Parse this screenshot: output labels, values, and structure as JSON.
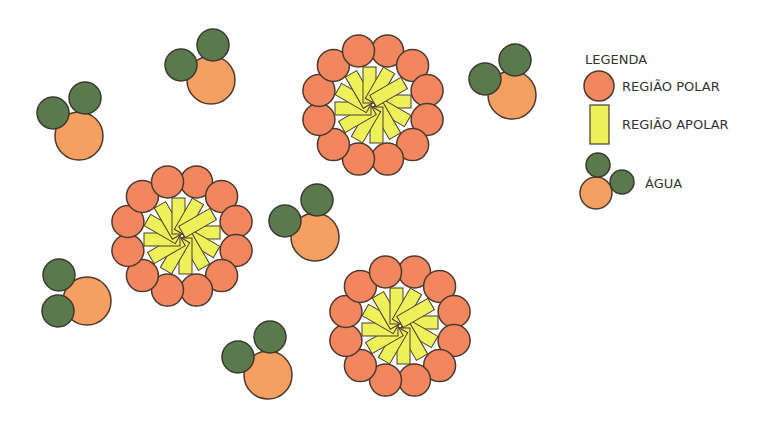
{
  "legend": {
    "title": "LEGENDA",
    "items": [
      {
        "label": "REGIÃO POLAR",
        "symbol": "polar-circle"
      },
      {
        "label": "REGIÃO APOLAR",
        "symbol": "apolar-rectangle"
      },
      {
        "label": "ÁGUA",
        "symbol": "water-molecule"
      }
    ]
  },
  "colors": {
    "polar": "#f2875f",
    "apolar": "#eef25a",
    "water_oxygen": "#f5a060",
    "water_hydrogen": "#5a7a4e",
    "stroke": "#4a3a30"
  },
  "micelles": [
    {
      "cx": 373,
      "cy": 105
    },
    {
      "cx": 182,
      "cy": 236
    },
    {
      "cx": 400,
      "cy": 326
    }
  ],
  "water_molecules": [
    {
      "ox": 79,
      "oy": 136,
      "h1x": 53,
      "h1y": 113,
      "h2x": 85,
      "h2y": 98
    },
    {
      "ox": 211,
      "oy": 80,
      "h1x": 181,
      "h1y": 65,
      "h2x": 213,
      "h2y": 45
    },
    {
      "ox": 512,
      "oy": 95,
      "h1x": 485,
      "h1y": 79,
      "h2x": 515,
      "h2y": 60
    },
    {
      "ox": 315,
      "oy": 237,
      "h1x": 285,
      "h1y": 221,
      "h2x": 317,
      "h2y": 200
    },
    {
      "ox": 87,
      "oy": 301,
      "h1x": 58,
      "h1y": 311,
      "h2x": 59,
      "h2y": 275
    },
    {
      "ox": 268,
      "oy": 375,
      "h1x": 238,
      "h1y": 357,
      "h2x": 270,
      "h2y": 337
    }
  ]
}
